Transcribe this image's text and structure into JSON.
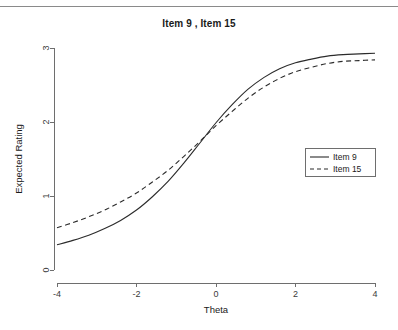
{
  "figure": {
    "title": "Item 9 , Item 15",
    "has_top_rule": true,
    "background_color": "#ffffff",
    "line_color": "#2b2b2b",
    "axis_color": "#6e6e6e"
  },
  "chart_data": {
    "type": "line",
    "title": "Item 9 , Item 15",
    "xlabel": "Theta",
    "ylabel": "Expected Rating",
    "xlim": [
      -4,
      4
    ],
    "ylim": [
      0,
      3
    ],
    "xticks": [
      -4,
      -2,
      0,
      2,
      4
    ],
    "xtick_labels": [
      "-4",
      "-2",
      "0",
      "2",
      "4"
    ],
    "yticks": [
      0,
      1,
      2,
      3
    ],
    "ytick_labels": [
      "0",
      "1",
      "2",
      "3"
    ],
    "grid": false,
    "legend_position": "right-center",
    "x": [
      -4,
      -3.6,
      -3.2,
      -2.8,
      -2.4,
      -2,
      -1.6,
      -1.2,
      -0.8,
      -0.4,
      0,
      0.4,
      0.8,
      1.2,
      1.6,
      2,
      2.4,
      2.8,
      3.2,
      3.6,
      4
    ],
    "series": [
      {
        "name": "Item 9",
        "style": "solid",
        "color": "#2b2b2b",
        "values": [
          0.34,
          0.4,
          0.47,
          0.56,
          0.67,
          0.81,
          0.99,
          1.2,
          1.45,
          1.72,
          1.99,
          2.23,
          2.44,
          2.6,
          2.72,
          2.8,
          2.85,
          2.89,
          2.91,
          2.92,
          2.93
        ]
      },
      {
        "name": "Item 15",
        "style": "dashed",
        "color": "#2b2b2b",
        "values": [
          0.57,
          0.64,
          0.72,
          0.81,
          0.92,
          1.04,
          1.19,
          1.35,
          1.54,
          1.74,
          1.95,
          2.14,
          2.32,
          2.47,
          2.59,
          2.68,
          2.74,
          2.79,
          2.82,
          2.83,
          2.84
        ]
      }
    ],
    "legend": [
      {
        "label": "Item 9",
        "style": "solid"
      },
      {
        "label": "Item 15",
        "style": "dashed"
      }
    ]
  }
}
